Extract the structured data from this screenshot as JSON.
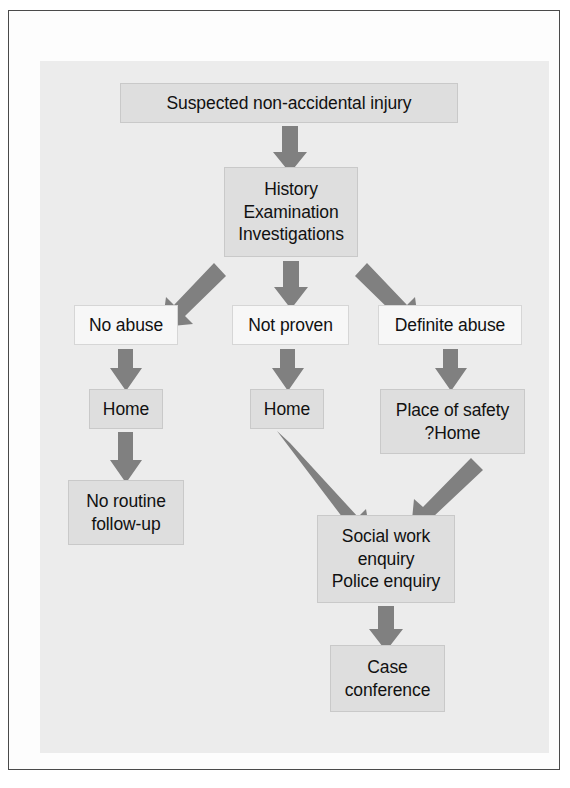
{
  "figure": {
    "type": "flowchart",
    "orientation": "top-to-bottom",
    "colors": {
      "panel_background": "#ececec",
      "node_fill": "#dedede",
      "node_fill_light": "#f7f7f7",
      "node_border": "#c9c9c9",
      "arrow": "#808080",
      "text": "#111111",
      "frame": "#4a4a4a",
      "page_background": "#ffffff"
    }
  },
  "nodes": [
    {
      "id": "suspected",
      "lines": [
        "Suspected non-accidental injury"
      ],
      "style": "filled",
      "x": 120,
      "y": 83,
      "w": 338,
      "h": 40
    },
    {
      "id": "assessment",
      "lines": [
        "History",
        "Examination",
        "Investigations"
      ],
      "style": "filled",
      "x": 224,
      "y": 167,
      "w": 134,
      "h": 90
    },
    {
      "id": "no-abuse",
      "lines": [
        "No abuse"
      ],
      "style": "light",
      "x": 74,
      "y": 305,
      "w": 104,
      "h": 40
    },
    {
      "id": "not-proven",
      "lines": [
        "Not proven"
      ],
      "style": "light",
      "x": 232,
      "y": 305,
      "w": 117,
      "h": 40
    },
    {
      "id": "definite-abuse",
      "lines": [
        "Definite abuse"
      ],
      "style": "light",
      "x": 378,
      "y": 305,
      "w": 144,
      "h": 40
    },
    {
      "id": "home-left",
      "lines": [
        "Home"
      ],
      "style": "filled",
      "x": 89,
      "y": 389,
      "w": 74,
      "h": 40
    },
    {
      "id": "home-middle",
      "lines": [
        "Home"
      ],
      "style": "filled",
      "x": 250,
      "y": 389,
      "w": 74,
      "h": 40
    },
    {
      "id": "place-of-safety",
      "lines": [
        "Place of safety",
        "?Home"
      ],
      "style": "filled",
      "x": 380,
      "y": 389,
      "w": 145,
      "h": 65
    },
    {
      "id": "no-routine-follow-up",
      "lines": [
        "No routine",
        "follow-up"
      ],
      "style": "filled",
      "x": 68,
      "y": 480,
      "w": 116,
      "h": 65
    },
    {
      "id": "social-work",
      "lines": [
        "Social work",
        "enquiry",
        "Police enquiry"
      ],
      "style": "filled",
      "x": 317,
      "y": 515,
      "w": 138,
      "h": 88
    },
    {
      "id": "case-conference",
      "lines": [
        "Case",
        "conference"
      ],
      "style": "filled",
      "x": 330,
      "y": 645,
      "w": 115,
      "h": 67
    }
  ],
  "edges": [
    {
      "id": "suspected-to-assessment",
      "from": "suspected",
      "to": "assessment",
      "direction": "down"
    },
    {
      "id": "assessment-to-no-abuse",
      "from": "assessment",
      "to": "no-abuse",
      "direction": "down-left"
    },
    {
      "id": "assessment-to-not-proven",
      "from": "assessment",
      "to": "not-proven",
      "direction": "down"
    },
    {
      "id": "assessment-to-definite-abuse",
      "from": "assessment",
      "to": "definite-abuse",
      "direction": "down-right"
    },
    {
      "id": "no-abuse-to-home-left",
      "from": "no-abuse",
      "to": "home-left",
      "direction": "down"
    },
    {
      "id": "not-proven-to-home-middle",
      "from": "not-proven",
      "to": "home-middle",
      "direction": "down"
    },
    {
      "id": "definite-abuse-to-place-of-safety",
      "from": "definite-abuse",
      "to": "place-of-safety",
      "direction": "down"
    },
    {
      "id": "home-left-to-no-routine",
      "from": "home-left",
      "to": "no-routine-follow-up",
      "direction": "down"
    },
    {
      "id": "home-middle-to-social-work",
      "from": "home-middle",
      "to": "social-work",
      "direction": "down-right"
    },
    {
      "id": "place-of-safety-to-social-work",
      "from": "place-of-safety",
      "to": "social-work",
      "direction": "down-left"
    },
    {
      "id": "social-work-to-case-conference",
      "from": "social-work",
      "to": "case-conference",
      "direction": "down"
    }
  ]
}
